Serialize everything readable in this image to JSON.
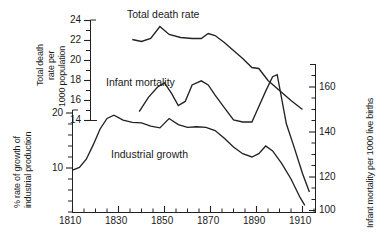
{
  "chart_data": {
    "type": "line",
    "title": "",
    "xlabel": "",
    "grid": false,
    "legend_position": "inline-annotations",
    "x_axis": {
      "label": "",
      "range": [
        1810,
        1915
      ],
      "major_ticks": [
        1810,
        1830,
        1850,
        1870,
        1890,
        1910
      ],
      "minor_tick_step": 5
    },
    "axes": [
      {
        "id": "death_rate",
        "side": "left-inner",
        "label_lines": [
          "Total death",
          "rate per",
          "1000 population"
        ],
        "label": "Total death rate per 1000 population",
        "range": [
          14,
          24
        ],
        "ticks": [
          14,
          16,
          18,
          20,
          22,
          24
        ],
        "minor_tick_step": 1
      },
      {
        "id": "industrial_production",
        "side": "left-outer",
        "label_lines": [
          "% rate of growth of",
          "industrial production"
        ],
        "label": "% rate of growth of industrial production",
        "range": [
          2,
          23
        ],
        "ticks": [
          10,
          20
        ],
        "minor_tick_step": 2
      },
      {
        "id": "infant_mortality",
        "side": "right",
        "label": "Infant mortality per 1000 live births",
        "range": [
          92,
          172
        ],
        "ticks": [
          100,
          120,
          140,
          160
        ],
        "minor_tick_step": 5
      }
    ],
    "series": [
      {
        "name": "Total death rate",
        "axis": "death_rate",
        "unit": "deaths per 1000 population",
        "annotation": "Total death rate",
        "points": [
          {
            "x": 1836,
            "y": 22.1
          },
          {
            "x": 1840,
            "y": 21.9
          },
          {
            "x": 1844,
            "y": 22.2
          },
          {
            "x": 1848,
            "y": 23.4
          },
          {
            "x": 1852,
            "y": 22.6
          },
          {
            "x": 1857,
            "y": 22.3
          },
          {
            "x": 1862,
            "y": 22.2
          },
          {
            "x": 1866,
            "y": 22.2
          },
          {
            "x": 1869,
            "y": 22.7
          },
          {
            "x": 1872,
            "y": 22.5
          },
          {
            "x": 1876,
            "y": 21.8
          },
          {
            "x": 1880,
            "y": 21.0
          },
          {
            "x": 1884,
            "y": 20.2
          },
          {
            "x": 1888,
            "y": 19.3
          },
          {
            "x": 1891,
            "y": 19.2
          },
          {
            "x": 1895,
            "y": 18.0
          },
          {
            "x": 1900,
            "y": 17.0
          },
          {
            "x": 1905,
            "y": 16.0
          },
          {
            "x": 1910,
            "y": 15.1
          }
        ]
      },
      {
        "name": "Infant mortality",
        "axis": "infant_mortality",
        "unit": "deaths per 1000 live births",
        "annotation": "Infant mortality",
        "points": [
          {
            "x": 1839,
            "y": 148
          },
          {
            "x": 1843,
            "y": 155
          },
          {
            "x": 1847,
            "y": 160
          },
          {
            "x": 1850,
            "y": 162
          },
          {
            "x": 1853,
            "y": 157
          },
          {
            "x": 1856,
            "y": 151
          },
          {
            "x": 1859,
            "y": 153
          },
          {
            "x": 1862,
            "y": 161
          },
          {
            "x": 1866,
            "y": 163
          },
          {
            "x": 1869,
            "y": 161
          },
          {
            "x": 1872,
            "y": 156
          },
          {
            "x": 1876,
            "y": 150
          },
          {
            "x": 1880,
            "y": 144
          },
          {
            "x": 1884,
            "y": 143
          },
          {
            "x": 1888,
            "y": 143
          },
          {
            "x": 1890,
            "y": 148
          },
          {
            "x": 1894,
            "y": 158
          },
          {
            "x": 1897,
            "y": 165
          },
          {
            "x": 1899,
            "y": 166
          },
          {
            "x": 1903,
            "y": 142
          },
          {
            "x": 1906,
            "y": 132
          },
          {
            "x": 1910,
            "y": 118
          },
          {
            "x": 1913,
            "y": 109
          }
        ]
      },
      {
        "name": "Industrial growth",
        "axis": "industrial_production",
        "unit": "% rate of growth of industrial production",
        "annotation": "Industrial growth",
        "points": [
          {
            "x": 1810,
            "y": 9.6
          },
          {
            "x": 1813,
            "y": 10.1
          },
          {
            "x": 1816,
            "y": 11.6
          },
          {
            "x": 1819,
            "y": 14.2
          },
          {
            "x": 1822,
            "y": 17.1
          },
          {
            "x": 1825,
            "y": 19.0
          },
          {
            "x": 1828,
            "y": 19.6
          },
          {
            "x": 1832,
            "y": 18.7
          },
          {
            "x": 1836,
            "y": 18.3
          },
          {
            "x": 1840,
            "y": 18.2
          },
          {
            "x": 1844,
            "y": 17.6
          },
          {
            "x": 1848,
            "y": 17.3
          },
          {
            "x": 1852,
            "y": 19.0
          },
          {
            "x": 1856,
            "y": 17.9
          },
          {
            "x": 1860,
            "y": 17.4
          },
          {
            "x": 1864,
            "y": 17.5
          },
          {
            "x": 1868,
            "y": 17.4
          },
          {
            "x": 1872,
            "y": 16.8
          },
          {
            "x": 1876,
            "y": 15.4
          },
          {
            "x": 1880,
            "y": 13.8
          },
          {
            "x": 1884,
            "y": 12.6
          },
          {
            "x": 1888,
            "y": 12.0
          },
          {
            "x": 1891,
            "y": 12.6
          },
          {
            "x": 1894,
            "y": 14.0
          },
          {
            "x": 1897,
            "y": 13.1
          },
          {
            "x": 1901,
            "y": 10.8
          },
          {
            "x": 1905,
            "y": 8.0
          },
          {
            "x": 1909,
            "y": 4.6
          },
          {
            "x": 1911,
            "y": 3.2
          }
        ]
      }
    ],
    "colors": {
      "line": "#222222",
      "axis": "#222222",
      "background": "#ffffff"
    }
  },
  "labels": {
    "total_death_rate": "Total death rate",
    "infant_mortality": "Infant mortality",
    "industrial_growth": "Industrial growth",
    "death_axis_l1": "Total death",
    "death_axis_l2": "rate per",
    "death_axis_l3": "1000 population",
    "industrial_axis_l1": "% rate of growth of",
    "industrial_axis_l2": "industrial production",
    "infant_axis": "Infant mortality per 1000 live births",
    "t14": "14",
    "t16": "16",
    "t18": "18",
    "t20": "20",
    "t22": "22",
    "t24": "24",
    "i10": "10",
    "i20": "20",
    "r100": "100",
    "r120": "120",
    "r140": "140",
    "r160": "160",
    "x1810": "1810",
    "x1830": "1830",
    "x1850": "1850",
    "x1870": "1870",
    "x1890": "1890",
    "x1910": "1910"
  }
}
